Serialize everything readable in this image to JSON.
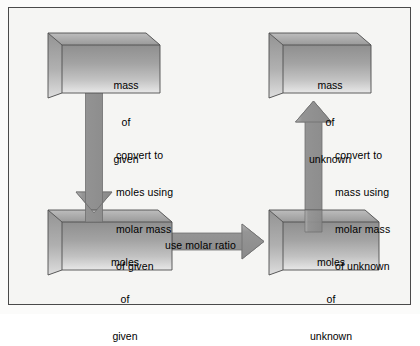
{
  "diagram": {
    "background_color": "#f5f5f3",
    "border_color": "#4a4a4a",
    "box_fill_color": "#a9a9a9",
    "arrow_color": "#8c8c8c"
  },
  "boxes": [
    {
      "id": "mass-of-given",
      "line1": "mass",
      "line2": "of",
      "line3": "given"
    },
    {
      "id": "mass-of-unknown",
      "line1": "mass",
      "line2": "of",
      "line3": "unknown"
    },
    {
      "id": "moles-of-given",
      "line1": "moles",
      "line2": "of",
      "line3": "given"
    },
    {
      "id": "moles-of-unknown",
      "line1": "moles",
      "line2": "of",
      "line3": "unknown"
    }
  ],
  "arrows": [
    {
      "id": "convert-given-to-moles",
      "direction": "down",
      "line1": "convert to",
      "line2": "moles using",
      "line3": "molar mass",
      "line4": "of given"
    },
    {
      "id": "use-molar-ratio",
      "direction": "right",
      "line1": "use molar ratio",
      "line2": "",
      "line3": "",
      "line4": ""
    },
    {
      "id": "convert-moles-to-mass",
      "direction": "up",
      "line1": "convert to",
      "line2": "mass using",
      "line3": "molar mass",
      "line4": "of unknown"
    }
  ]
}
